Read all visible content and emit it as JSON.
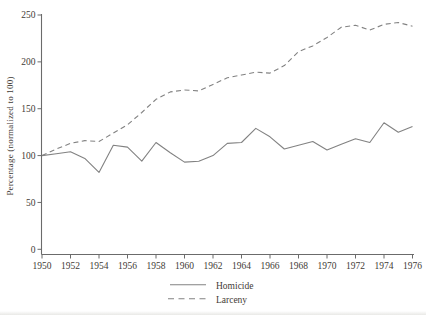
{
  "figure": {
    "background": "#ffffff",
    "text_color": "#3f3b36",
    "axis_color": "#6b6b6b",
    "line_color": "#828282"
  },
  "chart_data": {
    "type": "line",
    "title": "",
    "xlabel": "",
    "ylabel": "Percentage (normalized to 100)",
    "x": [
      1950,
      1951,
      1952,
      1953,
      1954,
      1955,
      1956,
      1957,
      1958,
      1959,
      1960,
      1961,
      1962,
      1963,
      1964,
      1965,
      1966,
      1967,
      1968,
      1969,
      1970,
      1971,
      1972,
      1973,
      1974,
      1975,
      1976
    ],
    "series": [
      {
        "name": "Homicide",
        "line_style": "solid",
        "values": [
          100,
          102,
          104,
          97,
          82,
          111,
          109,
          94,
          114,
          103,
          93,
          94,
          100,
          113,
          114,
          129,
          120,
          107,
          111,
          115,
          106,
          112,
          118,
          114,
          135,
          125,
          131
        ]
      },
      {
        "name": "Larceny",
        "line_style": "dashed",
        "values": [
          100,
          107,
          113,
          116,
          115,
          124,
          133,
          146,
          160,
          168,
          170,
          169,
          176,
          183,
          186,
          189,
          188,
          196,
          211,
          217,
          226,
          237,
          239,
          234,
          240,
          242,
          238
        ]
      }
    ],
    "ylim": [
      0,
      250
    ],
    "yticks": [
      0,
      50,
      100,
      150,
      200,
      250
    ],
    "xticks": [
      1950,
      1952,
      1954,
      1956,
      1958,
      1960,
      1962,
      1964,
      1966,
      1968,
      1970,
      1972,
      1974,
      1976
    ],
    "grid": false,
    "legend_position": "bottom-center"
  },
  "legend": {
    "items": [
      {
        "label": "Homicide",
        "style": "solid"
      },
      {
        "label": "Larceny",
        "style": "dashed"
      }
    ]
  }
}
